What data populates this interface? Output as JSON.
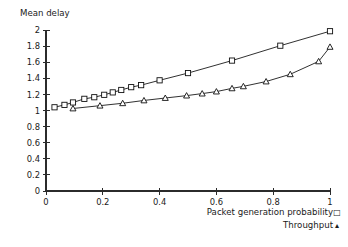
{
  "chart_data": {
    "type": "line",
    "title": "",
    "xlabel": "",
    "ylabel": "Mean delay",
    "xlim": [
      0,
      1
    ],
    "ylim": [
      0,
      2
    ],
    "grid": false,
    "legend_position": "bottom-right",
    "x_ticks": [
      "0",
      "0.2",
      "0.4",
      "0.6",
      "0.8",
      "1"
    ],
    "x_tick_values": [
      0,
      0.2,
      0.4,
      0.6,
      0.8,
      1
    ],
    "y_ticks": [
      "0",
      "0.2",
      "0.4",
      "0.6",
      "0.8",
      "1",
      "1.2",
      "1.4",
      "1.6",
      "1.8",
      "2"
    ],
    "y_tick_values": [
      0,
      0.2,
      0.4,
      0.6,
      0.8,
      1,
      1.2,
      1.4,
      1.6,
      1.8,
      2
    ],
    "series": [
      {
        "name": "Packet generation probability",
        "marker": "square",
        "x": [
          0.03,
          0.065,
          0.095,
          0.135,
          0.17,
          0.205,
          0.235,
          0.265,
          0.3,
          0.335,
          0.4,
          0.5,
          0.655,
          0.825,
          1.0
        ],
        "values": [
          1.04,
          1.07,
          1.1,
          1.145,
          1.165,
          1.195,
          1.225,
          1.255,
          1.29,
          1.315,
          1.375,
          1.465,
          1.62,
          1.805,
          1.985
        ]
      },
      {
        "name": "Throughput",
        "marker": "triangle",
        "x": [
          0.095,
          0.19,
          0.27,
          0.345,
          0.42,
          0.495,
          0.55,
          0.6,
          0.655,
          0.695,
          0.775,
          0.86,
          0.96,
          1.0
        ],
        "values": [
          1.025,
          1.06,
          1.09,
          1.125,
          1.155,
          1.185,
          1.21,
          1.235,
          1.275,
          1.3,
          1.36,
          1.45,
          1.61,
          1.79
        ]
      }
    ]
  },
  "legend": {
    "rows": [
      {
        "label": "Packet generation probability",
        "glyph": "□"
      },
      {
        "label": "Throughput",
        "glyph": "▴"
      }
    ]
  },
  "colors": {
    "axis": "#2b2b2b",
    "series": "#101010",
    "background": "#ffffff",
    "marker_fill": "#ffffff"
  }
}
